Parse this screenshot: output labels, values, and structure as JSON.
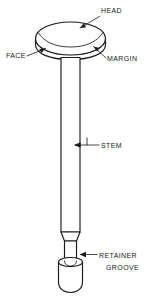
{
  "figure": {
    "background_color": "#ffffff",
    "line_color": "#1a1a1a",
    "callouts": [
      {
        "id": "head",
        "label": "HEAD",
        "label_x": 101,
        "label_y": 13,
        "anchor": "start"
      },
      {
        "id": "face",
        "label": "FACE",
        "label_x": 6,
        "label_y": 58,
        "anchor": "start"
      },
      {
        "id": "margin",
        "label": "MARGIN",
        "label_x": 107,
        "label_y": 61,
        "anchor": "start"
      },
      {
        "id": "stem",
        "label": "STEM",
        "label_x": 101,
        "label_y": 148,
        "anchor": "start"
      },
      {
        "id": "retainer_line_1",
        "label": "RETAINER",
        "label_x": 99,
        "label_y": 258,
        "anchor": "start"
      },
      {
        "id": "retainer_line_2",
        "label": "GROOVE",
        "label_x": 106,
        "label_y": 270,
        "anchor": "start"
      }
    ]
  }
}
